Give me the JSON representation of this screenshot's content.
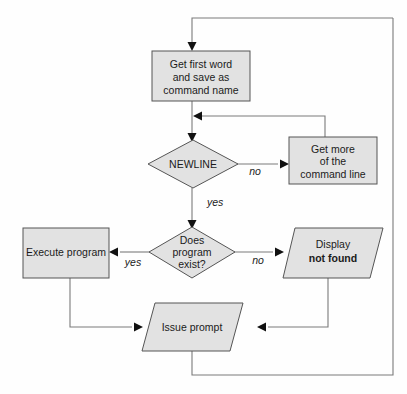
{
  "diagram": {
    "background_color": "#fefefe",
    "shape_fill_color": "#e2e2e2",
    "shape_stroke_color": "#555555",
    "connector_color": "#7a7a7a",
    "arrow_color": "#111111",
    "text_color": "#1b1b1b"
  },
  "nodes": {
    "get_first_word": {
      "type": "process",
      "line1": "Get first word",
      "line2": "and save as",
      "line3": "command name"
    },
    "newline_decision": {
      "type": "decision",
      "label": "NEWLINE"
    },
    "get_more": {
      "type": "process",
      "line1": "Get more",
      "line2": "of the",
      "line3": "command line"
    },
    "program_exists_decision": {
      "type": "decision",
      "line1": "Does",
      "line2": "program",
      "line3": "exist?"
    },
    "execute_program": {
      "type": "process",
      "label": "Execute program"
    },
    "display_not_found": {
      "type": "io",
      "line1": "Display",
      "line2": "not found"
    },
    "issue_prompt": {
      "type": "io",
      "label": "Issue prompt"
    }
  },
  "edge_labels": {
    "newline_no": "no",
    "newline_yes": "yes",
    "exists_yes": "yes",
    "exists_no": "no"
  }
}
